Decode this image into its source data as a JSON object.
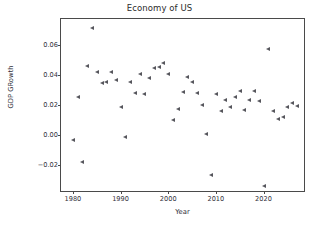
{
  "chart_data": {
    "type": "scatter",
    "title": "Economy of US",
    "xlabel": "Year",
    "ylabel": "GDP GRowth",
    "xlim": [
      1977.5,
      1978.0
    ],
    "x_range": [
      1977.5,
      2028.5
    ],
    "ylim": [
      -0.037,
      0.077
    ],
    "grid": false,
    "legend": null,
    "marker": "triangle-left",
    "marker_color": "#56565c",
    "xticks": [
      1980,
      1990,
      2000,
      2010,
      2020
    ],
    "xtick_labels": [
      "1980",
      "1990",
      "2000",
      "2010",
      "2020"
    ],
    "yticks": [
      -0.02,
      0.0,
      0.02,
      0.04,
      0.06
    ],
    "ytick_labels": [
      "−0.02",
      "0.00",
      "0.02",
      "0.04",
      "0.06"
    ],
    "points": [
      {
        "x": 1980,
        "y": -0.003
      },
      {
        "x": 1981,
        "y": 0.025
      },
      {
        "x": 1982,
        "y": -0.0178
      },
      {
        "x": 1983,
        "y": 0.0458
      },
      {
        "x": 1984,
        "y": 0.071
      },
      {
        "x": 1985,
        "y": 0.0421
      },
      {
        "x": 1986,
        "y": 0.0348
      },
      {
        "x": 1987,
        "y": 0.035
      },
      {
        "x": 1988,
        "y": 0.0418
      },
      {
        "x": 1989,
        "y": 0.0367
      },
      {
        "x": 1990,
        "y": 0.019
      },
      {
        "x": 1991,
        "y": -0.001
      },
      {
        "x": 1992,
        "y": 0.0352
      },
      {
        "x": 1993,
        "y": 0.028
      },
      {
        "x": 1994,
        "y": 0.0403
      },
      {
        "x": 1995,
        "y": 0.027
      },
      {
        "x": 1996,
        "y": 0.038
      },
      {
        "x": 1997,
        "y": 0.0445
      },
      {
        "x": 1998,
        "y": 0.045
      },
      {
        "x": 1999,
        "y": 0.0479
      },
      {
        "x": 2000,
        "y": 0.0408
      },
      {
        "x": 2001,
        "y": 0.01
      },
      {
        "x": 2002,
        "y": 0.0172
      },
      {
        "x": 2003,
        "y": 0.0283
      },
      {
        "x": 2004,
        "y": 0.0386
      },
      {
        "x": 2005,
        "y": 0.035
      },
      {
        "x": 2006,
        "y": 0.0281
      },
      {
        "x": 2007,
        "y": 0.02
      },
      {
        "x": 2008,
        "y": 0.001
      },
      {
        "x": 2009,
        "y": -0.0261
      },
      {
        "x": 2010,
        "y": 0.0271
      },
      {
        "x": 2011,
        "y": 0.016
      },
      {
        "x": 2012,
        "y": 0.0231
      },
      {
        "x": 2013,
        "y": 0.0184
      },
      {
        "x": 2014,
        "y": 0.0252
      },
      {
        "x": 2015,
        "y": 0.0295
      },
      {
        "x": 2016,
        "y": 0.017
      },
      {
        "x": 2017,
        "y": 0.0233
      },
      {
        "x": 2018,
        "y": 0.0296
      },
      {
        "x": 2019,
        "y": 0.0229
      },
      {
        "x": 2020,
        "y": -0.0334
      },
      {
        "x": 2021,
        "y": 0.0571
      },
      {
        "x": 2022,
        "y": 0.0158
      },
      {
        "x": 2023,
        "y": 0.0108
      },
      {
        "x": 2024,
        "y": 0.0118
      },
      {
        "x": 2025,
        "y": 0.0186
      },
      {
        "x": 2026,
        "y": 0.0213
      },
      {
        "x": 2027,
        "y": 0.0193
      }
    ]
  }
}
